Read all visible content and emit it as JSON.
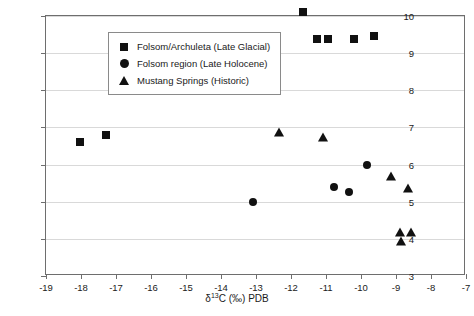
{
  "chart_data": {
    "type": "scatter",
    "title": "",
    "xlabel": "δ¹³C (‰) PDB",
    "ylabel": "δ¹⁵N (‰) PDB",
    "xlim": [
      -19,
      -7
    ],
    "ylim": [
      3,
      10
    ],
    "xticks": [
      -19,
      -18,
      -17,
      -16,
      -15,
      -14,
      -13,
      -12,
      -11,
      -10,
      -9,
      -8,
      -7
    ],
    "yticks": [
      3,
      4,
      5,
      6,
      7,
      8,
      9,
      10
    ],
    "grid": "horizontal",
    "legend_position": "top-left",
    "series": [
      {
        "name": "Folsom/Archuleta (Late Glacial)",
        "marker": "square",
        "color": "#111111",
        "points": [
          {
            "x": -18.03,
            "y": 6.6
          },
          {
            "x": -17.3,
            "y": 6.8
          },
          {
            "x": -13.29,
            "y": 9.28
          },
          {
            "x": -11.66,
            "y": 10.12
          },
          {
            "x": -11.26,
            "y": 9.38
          },
          {
            "x": -10.94,
            "y": 9.38
          },
          {
            "x": -10.2,
            "y": 9.38
          },
          {
            "x": -9.63,
            "y": 9.47
          }
        ]
      },
      {
        "name": "Folsom region (Late Holocene)",
        "marker": "circle",
        "color": "#111111",
        "points": [
          {
            "x": -13.09,
            "y": 5.0
          },
          {
            "x": -10.77,
            "y": 5.4
          },
          {
            "x": -10.34,
            "y": 5.25
          },
          {
            "x": -9.83,
            "y": 6.0
          }
        ]
      },
      {
        "name": "Mustang Springs (Historic)",
        "marker": "triangle",
        "color": "#111111",
        "points": [
          {
            "x": -12.34,
            "y": 6.9
          },
          {
            "x": -11.09,
            "y": 6.78
          },
          {
            "x": -9.14,
            "y": 5.73
          },
          {
            "x": -8.66,
            "y": 5.4
          },
          {
            "x": -8.89,
            "y": 4.2
          },
          {
            "x": -8.57,
            "y": 4.2
          },
          {
            "x": -8.86,
            "y": 3.97
          }
        ]
      }
    ]
  },
  "axes": {
    "x_tick_labels": [
      "-19",
      "-18",
      "-17",
      "-16",
      "-15",
      "-14",
      "-13",
      "-12",
      "-11",
      "-10",
      "-9",
      "-8",
      "-7"
    ],
    "y_tick_labels": [
      "3",
      "4",
      "5",
      "6",
      "7",
      "8",
      "9",
      "10"
    ],
    "x_title_prefix": "δ",
    "x_title_sup": "13",
    "x_title_suffix": "C (‰) PDB",
    "y_title_prefix": "δ",
    "y_title_sup": "15",
    "y_title_suffix": "N (‰) PDB"
  },
  "legend": {
    "items": [
      {
        "label": "Folsom/Archuleta (Late Glacial)",
        "marker": "square-marker"
      },
      {
        "label": "Folsom region (Late Holocene)",
        "marker": "circle-marker"
      },
      {
        "label": "Mustang Springs (Historic)",
        "marker": "triangle-marker"
      }
    ]
  }
}
